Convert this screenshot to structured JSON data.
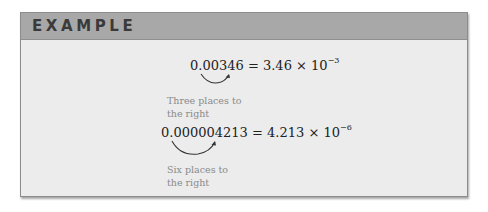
{
  "header": {
    "title": "EXAMPLE"
  },
  "examples": [
    {
      "decimal": "0.00346",
      "equals": "=",
      "mantissa": "3.46",
      "times": "×",
      "base": "10",
      "exponent": "−3",
      "note_line1": "Three places to",
      "note_line2": "the right"
    },
    {
      "decimal": "0.000004213",
      "equals": "=",
      "mantissa": "4.213",
      "times": "×",
      "base": "10",
      "exponent": "−6",
      "note_line1": "Six places to",
      "note_line2": "the right"
    }
  ],
  "colors": {
    "header_bg": "#a8a8a8",
    "body_bg": "#ececec",
    "title_text": "#3a3a3a",
    "note_text": "#8a8a8a"
  }
}
